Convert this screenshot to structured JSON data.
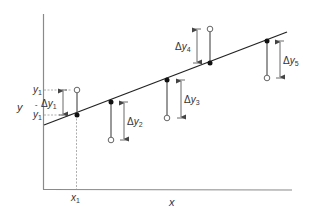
{
  "diagram": {
    "title": "",
    "axes": {
      "x_label": "x",
      "y_label": "y",
      "x1_label": "x",
      "x1_sub": "1",
      "y1_label": "y",
      "y1_sub": "1",
      "y1hat_label": "y",
      "y1hat_sub": "1",
      "y1hat_accent": "ˆ"
    },
    "regression_line": {
      "from": [
        44,
        125
      ],
      "to": [
        287,
        32
      ]
    },
    "residuals": [
      {
        "id": 1,
        "label": "Δy",
        "sub": "1",
        "fitted": [
          77,
          115
        ],
        "observed": [
          77,
          90
        ],
        "arrow_x": 63,
        "label_pos": "left"
      },
      {
        "id": 2,
        "label": "Δy",
        "sub": "2",
        "fitted": [
          111,
          102
        ],
        "observed": [
          111,
          140
        ],
        "arrow_x": 124,
        "label_pos": "right"
      },
      {
        "id": 3,
        "label": "Δy",
        "sub": "3",
        "fitted": [
          167,
          80
        ],
        "observed": [
          167,
          118
        ],
        "arrow_x": 181,
        "label_pos": "right"
      },
      {
        "id": 4,
        "label": "Δy",
        "sub": "4",
        "fitted": [
          210,
          63
        ],
        "observed": [
          210,
          29
        ],
        "arrow_x": 197,
        "label_pos": "left"
      },
      {
        "id": 5,
        "label": "Δy",
        "sub": "5",
        "fitted": [
          267,
          41
        ],
        "observed": [
          267,
          78
        ],
        "arrow_x": 280,
        "label_pos": "right"
      }
    ],
    "colors": {
      "axis": "#8a8a8a",
      "line": "#222222",
      "stem": "#555555",
      "arrow": "#444444",
      "text": "#333333"
    }
  }
}
